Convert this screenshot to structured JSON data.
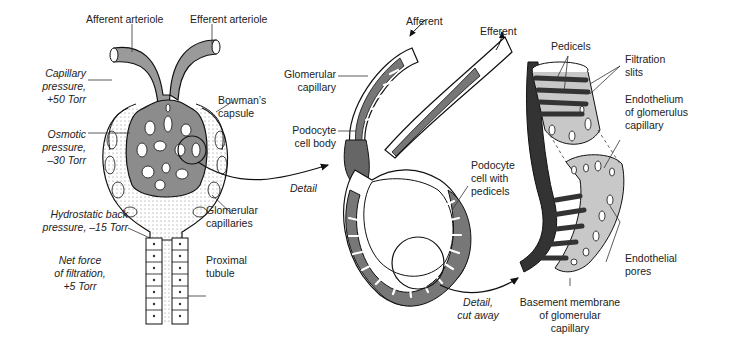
{
  "panel_left": {
    "title": "Glomerulus overview",
    "labels": {
      "afferent_arteriole": "Afferent arteriole",
      "efferent_arteriole": "Efferent arteriole",
      "capillary_pressure": [
        "Capillary",
        "pressure,",
        "+50 Torr"
      ],
      "osmotic_pressure": [
        "Osmotic",
        "pressure,",
        "–30 Torr"
      ],
      "hydrostatic_back": [
        "Hydrostatic back",
        "pressure, –15 Torr"
      ],
      "net_force": [
        "Net force",
        "of filtration,",
        "+5 Torr"
      ],
      "bowmans_capsule": [
        "Bowman’s",
        "capsule"
      ],
      "glomerular_capillaries": [
        "Glomerular",
        "capillaries"
      ],
      "proximal_tubule": [
        "Proximal",
        "tubule"
      ],
      "detail": "Detail"
    }
  },
  "panel_middle": {
    "labels": {
      "afferent": "Afferent",
      "efferent": "Efferent",
      "glomerular_capillary": [
        "Glomerular",
        "capillary"
      ],
      "podocyte_cell_body": [
        "Podocyte",
        "cell body"
      ],
      "podocyte_with_pedicels": [
        "Podocyte",
        "cell with",
        "pedicels"
      ],
      "detail_cut_away": [
        "Detail,",
        "cut away"
      ]
    }
  },
  "panel_right": {
    "labels": {
      "pedicels": "Pedicels",
      "filtration_slits": [
        "Filtration",
        "slits"
      ],
      "endothelium": [
        "Endothelium",
        "of glomerulus",
        "capillary"
      ],
      "endothelial_pores": [
        "Endothelial",
        "pores"
      ],
      "basement_membrane": [
        "Basement membrane",
        "of glomerular",
        "capillary"
      ]
    }
  },
  "colors": {
    "dark_fill": "#3a3a3a",
    "mid_fill": "#7a7a7a",
    "light_fill": "#c8c8c8",
    "stroke": "#111111",
    "text": "#222222"
  }
}
